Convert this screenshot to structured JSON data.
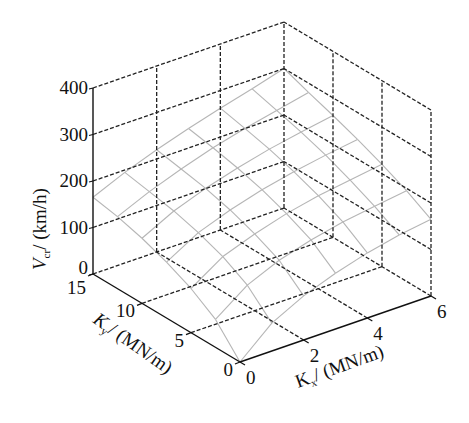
{
  "chart_data": {
    "type": "surface3d",
    "title": "",
    "xlabel": "K_x/(MN/m)",
    "ylabel": "K_y/(MN/m)",
    "zlabel": "V_cr/(km/h)",
    "x_ticks": [
      0,
      2,
      4,
      6
    ],
    "y_ticks": [
      0,
      5,
      10,
      15
    ],
    "z_ticks": [
      0,
      100,
      200,
      300,
      400
    ],
    "xlim": [
      0,
      6
    ],
    "ylim": [
      0,
      15
    ],
    "zlim": [
      0,
      400
    ],
    "grid": true,
    "x": [
      0,
      1,
      2,
      3,
      4,
      5,
      6
    ],
    "y": [
      0,
      2.5,
      5,
      7.5,
      10,
      12.5,
      15
    ],
    "z": [
      [
        0,
        60,
        95,
        120,
        140,
        155,
        165
      ],
      [
        60,
        110,
        140,
        160,
        175,
        185,
        195
      ],
      [
        95,
        140,
        165,
        185,
        200,
        210,
        220
      ],
      [
        120,
        160,
        185,
        205,
        220,
        232,
        242
      ],
      [
        140,
        175,
        200,
        220,
        237,
        250,
        262
      ],
      [
        155,
        185,
        210,
        232,
        250,
        265,
        280
      ],
      [
        165,
        195,
        220,
        242,
        262,
        280,
        300
      ]
    ]
  },
  "labels": {
    "z_axis_main": "V",
    "z_axis_sub": "cr",
    "z_axis_unit": "/ (km/h)",
    "y_axis_main": "K",
    "y_axis_sub": "y",
    "y_axis_unit": "/ (MN/m)",
    "x_axis_main": "K",
    "x_axis_sub": "x",
    "x_axis_unit": "/ (MN/m)"
  },
  "colors": {
    "axis": "#111111",
    "grid": "#222222",
    "surface": "#b5b5b5"
  }
}
